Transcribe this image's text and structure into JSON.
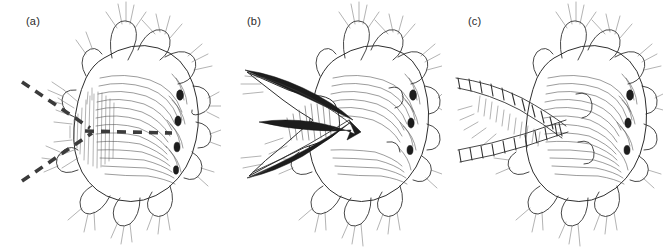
{
  "figure": {
    "kind": "scientific-line-illustration",
    "background_color": "#ffffff",
    "ink_color": "#3a3a3a",
    "dash_color": "#3b3b3b",
    "jaw_color": "#1d1d1d",
    "width": 663,
    "height": 251,
    "panel_count": 3
  },
  "panels": [
    {
      "id": "a",
      "label": "(a)",
      "label_x": 26,
      "label_y": 15,
      "caption_state": "head with proboscis retracted; dashed guide lines converge at the anterior mouth opening",
      "annotations": {
        "dashed_lines": [
          {
            "name": "upper-diagonal-dashed-line",
            "x1": 22,
            "y1": 82,
            "x2": 90,
            "y2": 128
          },
          {
            "name": "horizontal-dashed-line",
            "x1": 85,
            "y1": 131,
            "x2": 172,
            "y2": 133
          },
          {
            "name": "lower-diagonal-dashed-line",
            "x1": 22,
            "y1": 181,
            "x2": 92,
            "y2": 133
          }
        ],
        "dash_pattern": "9 7",
        "dash_width": 3.6,
        "convergence_point": {
          "x": 89,
          "y": 130
        }
      }
    },
    {
      "id": "b",
      "label": "(b)",
      "label_x": 26,
      "label_y": 15,
      "caption_state": "proboscis everted exposing the paired dark sickle-shaped jaws",
      "annotations": {
        "jaws": [
          {
            "name": "upper-jaw",
            "description": "long slender curved blade directed antero-left"
          },
          {
            "name": "lower-jaw",
            "description": "second slender curved blade below the upper jaw"
          },
          {
            "name": "inner-jaw",
            "description": "thick solid black recurved jaw forming the dark arrow-like mass"
          }
        ],
        "pharynx": {
          "name": "everted-pharynx",
          "description": "striated eversible pharynx funnel"
        }
      }
    },
    {
      "id": "c",
      "label": "(c)",
      "label_x": 26,
      "label_y": 15,
      "caption_state": "paired articulated grooved palps / antennae extended forward",
      "annotations": {
        "appendages": [
          {
            "name": "upper-articulated-palp",
            "segments": 11,
            "description": "ladder-like jointed appendage directed antero-dorsally"
          },
          {
            "name": "lower-articulated-palp",
            "segments": 10,
            "description": "ladder-like jointed appendage directed antero-ventrally"
          }
        ]
      }
    }
  ]
}
